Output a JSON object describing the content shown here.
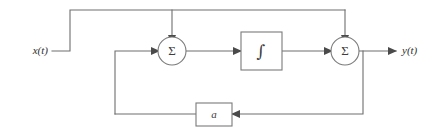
{
  "diagram": {
    "input_label": "x(t)",
    "output_label": "y(t)",
    "summer_one_symbol": "Σ",
    "summer_two_symbol": "Σ",
    "integrator_symbol": "∫",
    "gain_label": "a",
    "colors": {
      "wire": "#6e6e6e",
      "outline": "#7a7a7a",
      "arrow": "#4a4a4a",
      "text": "#2f2f2f",
      "background": "#ffffff"
    }
  }
}
